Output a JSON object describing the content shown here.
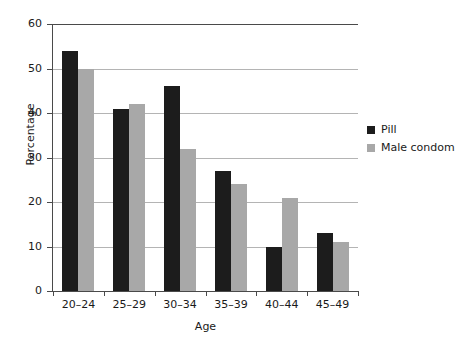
{
  "chart_data": {
    "type": "bar",
    "title": "",
    "xlabel": "Age",
    "ylabel": "Percentage",
    "categories": [
      "20–24",
      "25–29",
      "30–34",
      "35–39",
      "40–44",
      "45–49"
    ],
    "series": [
      {
        "name": "Pill",
        "color": "#1c1c1c",
        "values": [
          54,
          41,
          46,
          27,
          10,
          13
        ]
      },
      {
        "name": "Male condom",
        "color": "#a8a8a8",
        "values": [
          50,
          42,
          32,
          24,
          21,
          11
        ]
      }
    ],
    "ylim": [
      0,
      60
    ],
    "yticks": [
      0,
      10,
      20,
      30,
      40,
      50,
      60
    ],
    "ytick_labels": [
      "0",
      "10",
      "20",
      "30",
      "40",
      "50",
      "60"
    ],
    "grid": true,
    "grid_axis": "y",
    "legend_position": "right"
  },
  "legend": {
    "entries": [
      {
        "label": "Pill"
      },
      {
        "label": "Male condom"
      }
    ]
  },
  "axes": {
    "y_title": "Percentage",
    "x_title": "Age"
  }
}
